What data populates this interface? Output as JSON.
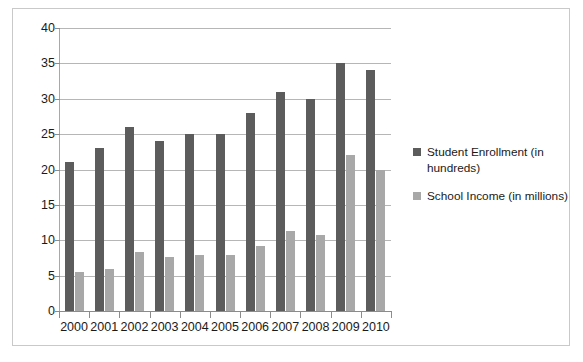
{
  "chart_data": {
    "type": "bar",
    "title": "",
    "xlabel": "",
    "ylabel": "",
    "ylim": [
      0,
      40
    ],
    "yticks": [
      0,
      5,
      10,
      15,
      20,
      25,
      30,
      35,
      40
    ],
    "grid": true,
    "legend_position": "right",
    "categories": [
      "2000",
      "2001",
      "2002",
      "2003",
      "2004",
      "2005",
      "2006",
      "2007",
      "2008",
      "2009",
      "2010"
    ],
    "series": [
      {
        "name": "Student Enrollment (in hundreds)",
        "color": "#5c5c5c",
        "values": [
          21,
          23,
          26,
          24,
          25,
          25,
          28,
          31,
          30,
          35,
          34
        ]
      },
      {
        "name": "School Income (in millions)",
        "color": "#a8a8a8",
        "values": [
          5.5,
          6,
          8.3,
          7.7,
          7.9,
          7.9,
          9.2,
          11.3,
          10.8,
          22,
          20
        ]
      }
    ]
  },
  "legend": {
    "entries": [
      {
        "label_line1": "Student Enrollment (in",
        "label_line2": "hundreds)"
      },
      {
        "label_line1": "School Income (in millions)",
        "label_line2": ""
      }
    ]
  }
}
